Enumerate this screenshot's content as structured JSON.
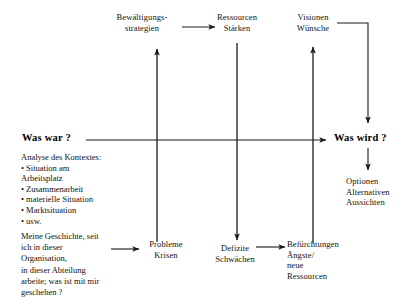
{
  "diagram": {
    "title_axis_left": "Was war ?",
    "title_axis_right": "Was wird ?",
    "nodes": {
      "bewaeltigungsstrategien": "Bewältigungs-\nstrategien",
      "ressourcen_staerken": "Ressourcen\nStärken",
      "visionen_wuensche": "Visionen\nWünsche",
      "probleme_krisen": "Probleme\nKrisen",
      "defizite_schwaechen": "Defizite\nSchwächen",
      "befuerchtungen": "Befürchtungen\nÄngste/\nneue\nRessourcen",
      "optionen": "Optionen\nAlternativen\nAussichten"
    },
    "context_block": {
      "heading": "Analyse des Kontextes:",
      "items": [
        "• Situation am\n   Arbeitsplatz",
        "• Zusammenarbeit",
        "• materielle Situation",
        "• Marktsituation",
        "• usw."
      ],
      "full_text": "Analyse des Kontextes:\n• Situation am\n   Arbeitsplatz\n• Zusammenarbeit\n• materielle Situation\n• Marktsituation\n• usw."
    },
    "story_block": "Meine Geschichte, seit\nich in dieser\nOrganisation,\nin dieser Abteilung\narbeite; was ist mit mir\ngeschehen ?",
    "colors": {
      "ink": "#111111",
      "line": "#1a1a1a",
      "background": "#ffffff"
    }
  }
}
